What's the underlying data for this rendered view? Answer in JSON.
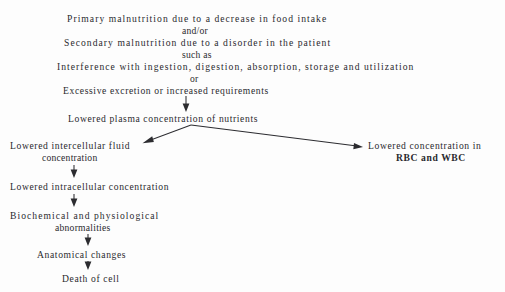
{
  "diagram": {
    "text_color": "#2a2a2e",
    "background_color": "#fdfdfd",
    "nodes": {
      "primary": "Primary malnutrition due to a decrease in food intake",
      "andor": "and/or",
      "secondary": "Secondary malnutrition due to a disorder in the patient",
      "such_as": "such as",
      "interference": "Interference with ingestion, digestion, absorption, storage and utilization",
      "or": "or",
      "excessive": "Excessive excretion or increased requirements",
      "plasma": "Lowered plasma concentration of nutrients",
      "intercellular_line1": "Lowered intercellular fluid",
      "intercellular_line2": "concentration",
      "rbc_line1": "Lowered concentration in",
      "rbc_line2": "RBC and WBC",
      "intracellular": "Lowered intracellular concentration",
      "biochemical_line1": "Biochemical and physiological",
      "biochemical_line2": "abnormalities",
      "anatomical": "Anatomical changes",
      "death": "Death of cell"
    },
    "arrows": [
      {
        "name": "arrow-excessive-to-plasma",
        "direction": "down"
      },
      {
        "name": "arrow-plasma-to-intercellular",
        "direction": "down-left"
      },
      {
        "name": "arrow-plasma-to-rbc",
        "direction": "down-right"
      },
      {
        "name": "arrow-intercellular-to-intracellular",
        "direction": "down"
      },
      {
        "name": "arrow-intracellular-to-biochemical",
        "direction": "down"
      },
      {
        "name": "arrow-biochemical-to-anatomical",
        "direction": "down"
      },
      {
        "name": "arrow-anatomical-to-death",
        "direction": "down"
      }
    ]
  }
}
